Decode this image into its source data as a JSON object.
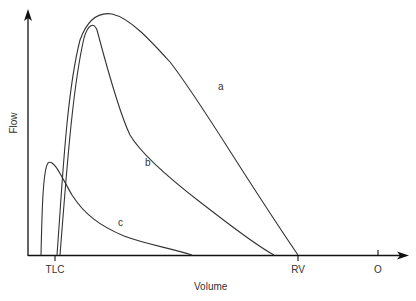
{
  "chart_data": {
    "type": "line",
    "title": "",
    "xlabel": "Volume",
    "ylabel": "Flow",
    "x_ticks": [
      {
        "label": "TLC",
        "px": 55
      },
      {
        "label": "RV",
        "px": 298
      },
      {
        "label": "O",
        "px": 378
      }
    ],
    "grid": false,
    "legend": "none (curves labeled inline)",
    "series": [
      {
        "name": "a",
        "label_pos": [
          218,
          82
        ],
        "description": "Normal flow-volume curve: rapid rise from TLC to high peak, near-linear descent to RV",
        "path": "M57,255 C62,190 66,95 80,40 C88,18 100,12 112,14 C130,18 150,40 170,62 C200,100 240,170 298,255"
      },
      {
        "name": "b",
        "label_pos": [
          145,
          158
        ],
        "description": "Obstructive curve: lower peak, scooped concave descent ending before RV",
        "path": "M60,255 C66,180 72,90 84,38 C88,24 94,22 97,30 C105,60 118,110 130,135 C140,152 165,175 200,202 C230,225 255,245 274,255"
      },
      {
        "name": "c",
        "label_pos": [
          118,
          218
        ],
        "description": "Severe restriction / low-volume curve: small peak near TLC, tail along baseline",
        "path": "M41,255 C42,210 43,170 48,163 C54,158 62,178 72,195 C84,214 100,226 124,236 C145,244 170,248 192,255"
      }
    ],
    "units": "arbitrary (schematic)"
  },
  "axes": {
    "x_label": "Volume",
    "y_label": "Flow",
    "tick_tlc": "TLC",
    "tick_rv": "RV",
    "tick_o": "O"
  },
  "labels": {
    "a": "a",
    "b": "b",
    "c": "c"
  },
  "colors": {
    "line": "#333333",
    "axis": "#111111",
    "background": "#ffffff"
  }
}
